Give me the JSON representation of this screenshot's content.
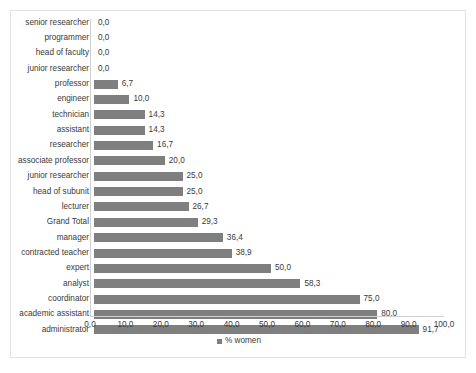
{
  "chart_data": {
    "type": "bar",
    "orientation": "horizontal",
    "title": "",
    "xlabel": "",
    "ylabel": "",
    "xlim": [
      0,
      100
    ],
    "xticks": [
      "0,0",
      "10,0",
      "20,0",
      "30,0",
      "40,0",
      "50,0",
      "60,0",
      "70,0",
      "80,0",
      "90,0",
      "100,0"
    ],
    "xtick_values": [
      0,
      10,
      20,
      30,
      40,
      50,
      60,
      70,
      80,
      90,
      100
    ],
    "grid": false,
    "legend": {
      "position": "bottom",
      "entries": [
        {
          "label": "% women",
          "color": "#7f7f7f"
        }
      ]
    },
    "series": [
      {
        "name": "% women",
        "color": "#7f7f7f",
        "categories": [
          "senior researcher",
          "programmer",
          "head of faculty",
          "junior researcher",
          "professor",
          "engineer",
          "technician",
          "assistant",
          "researcher",
          "associate professor",
          "junior researcher",
          "head of subunit",
          "lecturer",
          "Grand Total",
          "manager",
          "contracted teacher",
          "expert",
          "analyst",
          "coordinator",
          "academic assistant",
          "administrator"
        ],
        "values": [
          0.0,
          0.0,
          0.0,
          0.0,
          6.7,
          10.0,
          14.3,
          14.3,
          16.7,
          20.0,
          25.0,
          25.0,
          26.7,
          29.3,
          36.4,
          38.9,
          50.0,
          58.3,
          75.0,
          80.0,
          91.7
        ],
        "labels": [
          "0,0",
          "0,0",
          "0,0",
          "0,0",
          "6,7",
          "10,0",
          "14,3",
          "14,3",
          "16,7",
          "20,0",
          "25,0",
          "25,0",
          "26,7",
          "29,3",
          "36,4",
          "38,9",
          "50,0",
          "58,3",
          "75,0",
          "80,0",
          "91,7"
        ]
      }
    ]
  }
}
